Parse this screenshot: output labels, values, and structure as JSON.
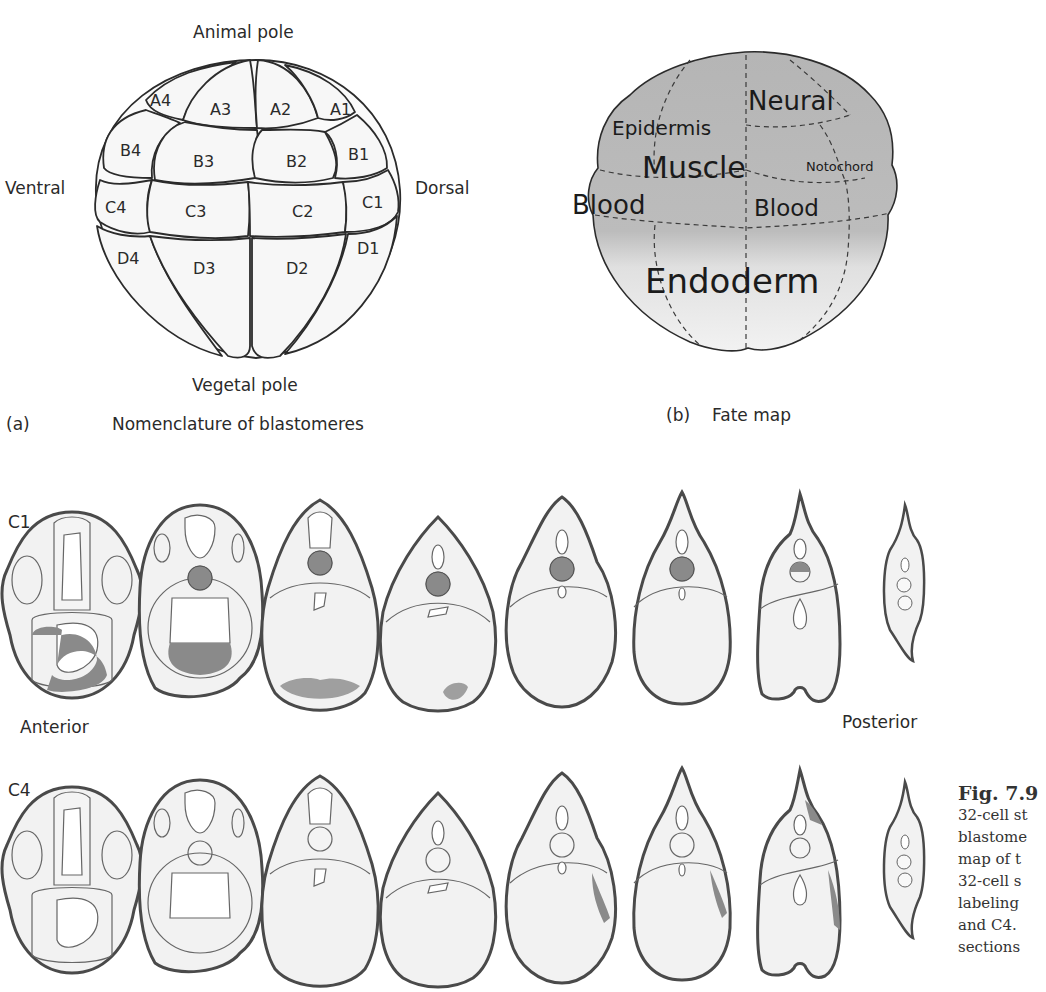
{
  "figure": {
    "panel_a": {
      "letter": "(a)",
      "title": "Nomenclature of blastomeres",
      "axis_labels": {
        "top": "Animal pole",
        "bottom": "Vegetal pole",
        "left": "Ventral",
        "right": "Dorsal"
      },
      "blastomeres": {
        "row_a": [
          "A4",
          "A3",
          "A2",
          "A1"
        ],
        "row_b": [
          "B4",
          "B3",
          "B2",
          "B1"
        ],
        "row_c": [
          "C4",
          "C3",
          "C2",
          "C1"
        ],
        "row_d": [
          "D4",
          "D3",
          "D2",
          "D1"
        ]
      }
    },
    "panel_b": {
      "letter": "(b)",
      "title": "Fate map",
      "regions": {
        "neural": "Neural",
        "epidermis": "Epidermis",
        "muscle": "Muscle",
        "notochord": "Notochord",
        "blood_left": "Blood",
        "blood_right": "Blood",
        "endoderm": "Endoderm"
      },
      "colors": {
        "animal_shade": "#b5b5b5",
        "vegetal_shade": "#ececec",
        "outline": "#2b2b2b"
      }
    },
    "panel_c": {
      "row1_label": "C1",
      "row2_label": "C4",
      "anterior_label": "Anterior",
      "posterior_label": "Posterior",
      "section_count": 8,
      "colors": {
        "tissue_fill": "#f1f1f1",
        "labeled_fill": "#8a8a8a",
        "outline": "#4a4a4a"
      }
    },
    "caption": {
      "title": "Fig. 7.9",
      "lines": [
        "32-cell st",
        "blastome",
        "map of t",
        "32-cell s",
        "labeling",
        "and C4.",
        "sections"
      ]
    }
  }
}
